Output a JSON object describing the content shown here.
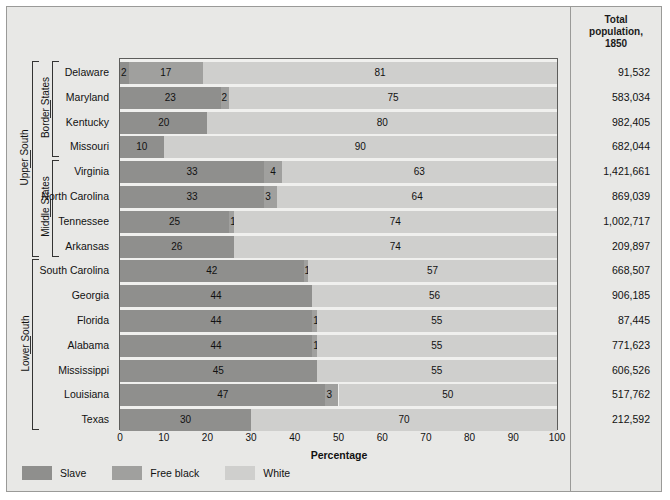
{
  "header": {
    "totals_title_line1": "Total",
    "totals_title_line2": "population,",
    "totals_title_line3": "1850"
  },
  "axis": {
    "xlabel": "Percentage",
    "ticks": [
      "0",
      "10",
      "20",
      "30",
      "40",
      "50",
      "60",
      "70",
      "80",
      "90",
      "100"
    ]
  },
  "legend": {
    "items": [
      {
        "label": "Slave",
        "color": "#8f8f8d",
        "key": "slave"
      },
      {
        "label": "Free black",
        "color": "#a0a09e",
        "key": "free_black"
      },
      {
        "label": "White",
        "color": "#cfcfcd",
        "key": "white"
      }
    ]
  },
  "groups": [
    {
      "label": "Upper South",
      "start": 0,
      "end": 7
    },
    {
      "label": "Border States",
      "start": 0,
      "end": 3
    },
    {
      "label": "Middle States",
      "start": 4,
      "end": 7
    },
    {
      "label": "Lower South",
      "start": 8,
      "end": 14
    }
  ],
  "chart_data": {
    "type": "bar",
    "orientation": "horizontal",
    "stacked": true,
    "title": "",
    "xlabel": "Percentage",
    "ylabel": "",
    "xlim": [
      0,
      100
    ],
    "grid": false,
    "legend_position": "bottom-left",
    "categories": [
      "Delaware",
      "Maryland",
      "Kentucky",
      "Missouri",
      "Virginia",
      "North Carolina",
      "Tennessee",
      "Arkansas",
      "South Carolina",
      "Georgia",
      "Florida",
      "Alabama",
      "Mississippi",
      "Louisiana",
      "Texas"
    ],
    "series": [
      {
        "name": "Slave",
        "values": [
          2,
          23,
          20,
          10,
          33,
          33,
          25,
          26,
          42,
          44,
          44,
          44,
          45,
          47,
          30
        ]
      },
      {
        "name": "Free black",
        "values": [
          17,
          2,
          0,
          0,
          4,
          3,
          1,
          0,
          1,
          0,
          1,
          1,
          0,
          3,
          0
        ]
      },
      {
        "name": "White",
        "values": [
          81,
          75,
          80,
          90,
          63,
          64,
          74,
          74,
          57,
          56,
          55,
          55,
          55,
          50,
          70
        ]
      }
    ],
    "total_population_1850": [
      "91,532",
      "583,034",
      "982,405",
      "682,044",
      "1,421,661",
      "869,039",
      "1,002,717",
      "209,897",
      "668,507",
      "906,185",
      "87,445",
      "771,623",
      "606,526",
      "517,762",
      "212,592"
    ]
  }
}
